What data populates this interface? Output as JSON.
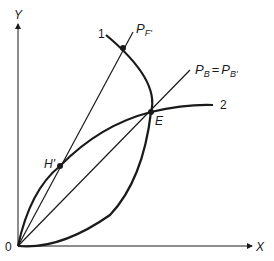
{
  "diagram": {
    "axes": {
      "y_label": "Y",
      "x_label": "X",
      "origin_label": "0"
    },
    "curves": [
      {
        "id": "curve-1",
        "label": "1"
      },
      {
        "id": "curve-2",
        "label": "2"
      }
    ],
    "rays": [
      {
        "id": "ray-pf",
        "label_main": "P",
        "label_sub": "F'"
      },
      {
        "id": "ray-pb",
        "label_main": "P",
        "label_sub": "B",
        "label_eq": "=",
        "label_main2": "P",
        "label_sub2": "B'"
      }
    ],
    "points": [
      {
        "id": "E",
        "label": "E"
      },
      {
        "id": "H",
        "label": "H'"
      }
    ],
    "colors": {
      "ink": "#1a1a1a",
      "background": "#ffffff"
    }
  }
}
